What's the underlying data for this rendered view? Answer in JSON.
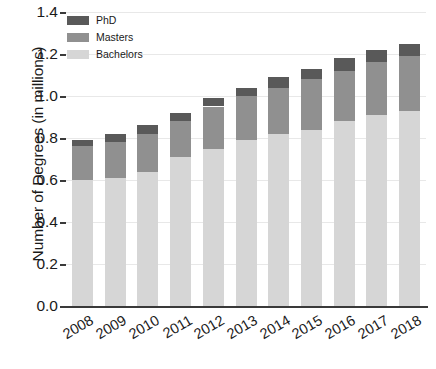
{
  "chart_data": {
    "type": "bar",
    "subtype": "stacked-bar",
    "title": "",
    "xlabel": "",
    "ylabel": "Number of Degrees (in millions)",
    "categories": [
      "2008",
      "2009",
      "2010",
      "2011",
      "2012",
      "2013",
      "2014",
      "2015",
      "2016",
      "2017",
      "2018"
    ],
    "series": [
      {
        "name": "Bachelors",
        "color": "#d6d6d6",
        "values": [
          0.6,
          0.61,
          0.64,
          0.71,
          0.75,
          0.79,
          0.82,
          0.84,
          0.88,
          0.91,
          0.93
        ]
      },
      {
        "name": "Masters",
        "color": "#909090",
        "values": [
          0.16,
          0.17,
          0.18,
          0.17,
          0.2,
          0.21,
          0.22,
          0.24,
          0.24,
          0.25,
          0.26
        ]
      },
      {
        "name": "PhD",
        "color": "#595959",
        "values": [
          0.03,
          0.04,
          0.04,
          0.04,
          0.04,
          0.04,
          0.05,
          0.05,
          0.06,
          0.06,
          0.06
        ]
      }
    ],
    "totals": [
      0.79,
      0.82,
      0.86,
      0.92,
      0.99,
      1.04,
      1.09,
      1.13,
      1.18,
      1.22,
      1.25
    ],
    "ylim": [
      0.0,
      1.4
    ],
    "ytick_values": [
      "0.0",
      "0.2",
      "0.4",
      "0.6",
      "0.8",
      "1.0",
      "1.2",
      "1.4"
    ],
    "grid": true,
    "grid_axis": "y",
    "legend_position": "upper-left",
    "legend_order": [
      "PhD",
      "Masters",
      "Bachelors"
    ],
    "xtick_rotation": -30
  }
}
